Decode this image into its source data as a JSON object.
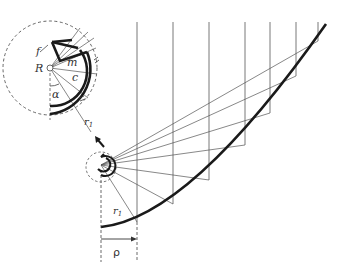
{
  "diagram": {
    "labels": {
      "R": "R",
      "f": "f",
      "m": "m",
      "c": "c",
      "alpha": "α",
      "r1_inset": "r",
      "r1_inset_sub": "1",
      "r1_main": "r",
      "r1_main_sub": "1",
      "rho": "ρ"
    },
    "colors": {
      "line": "#444444",
      "thick": "#1a1a1a",
      "background": "#ffffff"
    }
  }
}
